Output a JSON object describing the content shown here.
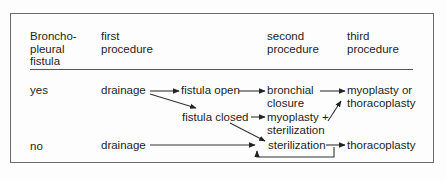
{
  "headers": {
    "col1": [
      "Broncho-",
      "pleural",
      "fistula"
    ],
    "col2": [
      "first",
      "procedure"
    ],
    "col3": [
      "second",
      "procedure"
    ],
    "col4": [
      "third",
      "procedure"
    ]
  },
  "rows": {
    "yes": {
      "label": "yes",
      "first": "drainage",
      "branch_open": "fistula open",
      "branch_closed": "fistula closed",
      "second_open": [
        "bronchial",
        "closure"
      ],
      "second_closed": [
        "myoplasty +",
        "sterilization"
      ],
      "third": [
        "myoplasty or",
        "thoracoplasty"
      ]
    },
    "no": {
      "label": "no",
      "first": "drainage",
      "second": "sterilization",
      "third": "thoracoplasty"
    }
  },
  "colors": {
    "text": "#1e1e1e",
    "lines": "#333333",
    "frame": "#6a6a6a"
  }
}
